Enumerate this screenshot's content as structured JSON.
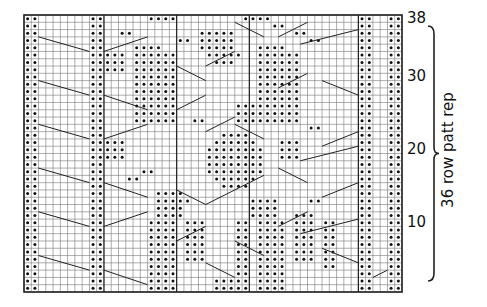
{
  "chart": {
    "columns": 52,
    "rows": 38,
    "row_labels": [
      {
        "row": 38,
        "text": "38"
      },
      {
        "row": 30,
        "text": "30"
      },
      {
        "row": 20,
        "text": "20"
      },
      {
        "row": 10,
        "text": "10"
      }
    ],
    "repeat_label": "36 row patt rep",
    "repeat_rows": [
      2,
      37
    ],
    "purl_columns_full": [
      0,
      1,
      9,
      10,
      46,
      47,
      50,
      51
    ],
    "purl_blocks": [
      {
        "cols": [
          17,
          20
        ],
        "rows": [
          1,
          10
        ]
      },
      {
        "cols": [
          18,
          21
        ],
        "rows": [
          11,
          14
        ]
      },
      {
        "cols": [
          32,
          35
        ],
        "rows": [
          1,
          10
        ]
      },
      {
        "cols": [
          31,
          34
        ],
        "rows": [
          11,
          13
        ]
      },
      {
        "cols": [
          22,
          24
        ],
        "rows": [
          5,
          10
        ]
      },
      {
        "cols": [
          29,
          30
        ],
        "rows": [
          3,
          10
        ]
      },
      {
        "cols": [
          37,
          39
        ],
        "rows": [
          5,
          11
        ]
      },
      {
        "cols": [
          41,
          42
        ],
        "rows": [
          4,
          10
        ]
      },
      {
        "cols": [
          26,
          30
        ],
        "rows": [
          2,
          2
        ]
      },
      {
        "cols": [
          26,
          30
        ],
        "rows": [
          1,
          1
        ]
      },
      {
        "cols": [
          25,
          32
        ],
        "rows": [
          17,
          20
        ]
      },
      {
        "cols": [
          26,
          31
        ],
        "rows": [
          16,
          16
        ]
      },
      {
        "cols": [
          26,
          31
        ],
        "rows": [
          21,
          21
        ]
      },
      {
        "cols": [
          27,
          30
        ],
        "rows": [
          15,
          15
        ]
      },
      {
        "cols": [
          27,
          30
        ],
        "rows": [
          22,
          22
        ]
      },
      {
        "cols": [
          11,
          13
        ],
        "rows": [
          19,
          21
        ]
      },
      {
        "cols": [
          35,
          37
        ],
        "rows": [
          19,
          21
        ]
      },
      {
        "cols": [
          16,
          17
        ],
        "rows": [
          17,
          17
        ]
      },
      {
        "cols": [
          31,
          32
        ],
        "rows": [
          17,
          17
        ]
      },
      {
        "cols": [
          14,
          15
        ],
        "rows": [
          16,
          16
        ]
      },
      {
        "cols": [
          21,
          22
        ],
        "rows": [
          13,
          13
        ]
      },
      {
        "cols": [
          39,
          40
        ],
        "rows": [
          13,
          13
        ]
      },
      {
        "cols": [
          15,
          20
        ],
        "rows": [
          24,
          33
        ]
      },
      {
        "cols": [
          15,
          18
        ],
        "rows": [
          34,
          34
        ]
      },
      {
        "cols": [
          32,
          37
        ],
        "rows": [
          24,
          33
        ]
      },
      {
        "cols": [
          32,
          35
        ],
        "rows": [
          34,
          34
        ]
      },
      {
        "cols": [
          11,
          13
        ],
        "rows": [
          31,
          33
        ]
      },
      {
        "cols": [
          29,
          31
        ],
        "rows": [
          24,
          26
        ]
      },
      {
        "cols": [
          35,
          37
        ],
        "rows": [
          26,
          28
        ]
      },
      {
        "cols": [
          24,
          28
        ],
        "rows": [
          34,
          36
        ]
      },
      {
        "cols": [
          25,
          29
        ],
        "rows": [
          33,
          33
        ]
      },
      {
        "cols": [
          26,
          28
        ],
        "rows": [
          32,
          32
        ]
      },
      {
        "cols": [
          17,
          20
        ],
        "rows": [
          38,
          38
        ]
      },
      {
        "cols": [
          30,
          33
        ],
        "rows": [
          38,
          38
        ]
      },
      {
        "cols": [
          13,
          14
        ],
        "rows": [
          36,
          36
        ]
      },
      {
        "cols": [
          21,
          22
        ],
        "rows": [
          35,
          35
        ]
      },
      {
        "cols": [
          37,
          38
        ],
        "rows": [
          36,
          36
        ]
      },
      {
        "cols": [
          39,
          40
        ],
        "rows": [
          35,
          35
        ]
      },
      {
        "cols": [
          34,
          35
        ],
        "rows": [
          37,
          37
        ]
      },
      {
        "cols": [
          23,
          24
        ],
        "rows": [
          24,
          24
        ]
      },
      {
        "cols": [
          39,
          40
        ],
        "rows": [
          23,
          23
        ]
      }
    ],
    "cable_lines": [
      [
        2,
        5,
        9,
        3
      ],
      [
        2,
        11,
        9,
        9
      ],
      [
        2,
        17,
        9,
        15
      ],
      [
        2,
        23,
        9,
        21
      ],
      [
        2,
        29,
        9,
        27
      ],
      [
        2,
        35,
        9,
        33
      ],
      [
        11,
        3,
        17,
        1
      ],
      [
        11,
        9,
        17,
        11
      ],
      [
        11,
        15,
        17,
        13
      ],
      [
        11,
        21,
        17,
        23
      ],
      [
        11,
        27,
        17,
        25
      ],
      [
        11,
        33,
        17,
        35
      ],
      [
        21,
        7,
        25,
        9
      ],
      [
        21,
        14,
        25,
        12
      ],
      [
        21,
        25,
        25,
        27
      ],
      [
        21,
        31,
        25,
        29
      ],
      [
        25,
        4,
        29,
        2
      ],
      [
        25,
        12,
        29,
        14
      ],
      [
        25,
        22,
        29,
        24
      ],
      [
        25,
        31,
        29,
        33
      ],
      [
        29,
        7,
        33,
        5
      ],
      [
        29,
        14,
        33,
        16
      ],
      [
        29,
        23,
        33,
        21
      ],
      [
        29,
        37,
        33,
        35
      ],
      [
        35,
        9,
        39,
        11
      ],
      [
        35,
        17,
        39,
        15
      ],
      [
        35,
        28,
        39,
        30
      ],
      [
        35,
        35,
        39,
        37
      ],
      [
        41,
        6,
        46,
        4
      ],
      [
        41,
        13,
        46,
        15
      ],
      [
        41,
        20,
        46,
        22
      ],
      [
        41,
        29,
        46,
        27
      ],
      [
        48,
        2,
        50,
        3
      ],
      [
        38,
        8,
        46,
        10
      ],
      [
        38,
        18,
        46,
        20
      ],
      [
        38,
        34,
        46,
        36
      ]
    ],
    "bold_vertical_lines": [
      11,
      21,
      31,
      46
    ]
  }
}
